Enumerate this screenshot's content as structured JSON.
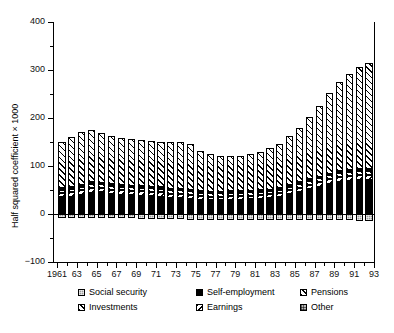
{
  "chart_data": {
    "type": "bar",
    "stacked": true,
    "title": "",
    "xlabel": "",
    "ylabel": "Half squared coefficient × 1000",
    "ylim": [
      -100,
      400
    ],
    "ytick_labels": [
      "400",
      "300",
      "200",
      "100",
      "0",
      "−100"
    ],
    "ytick_values": [
      400,
      300,
      200,
      100,
      0,
      -100
    ],
    "yminor_step": 50,
    "grid": false,
    "legend_position": "bottom",
    "x": [
      1961,
      1962,
      1963,
      1964,
      1965,
      1966,
      1967,
      1968,
      1969,
      1970,
      1971,
      1972,
      1973,
      1974,
      1975,
      1976,
      1977,
      1978,
      1979,
      1980,
      1981,
      1982,
      1983,
      1984,
      1985,
      1986,
      1987,
      1988,
      1989,
      1990,
      1991,
      1992
    ],
    "categories": [
      "1961",
      "62",
      "63",
      "64",
      "65",
      "66",
      "67",
      "68",
      "69",
      "70",
      "71",
      "72",
      "73",
      "74",
      "75",
      "76",
      "77",
      "78",
      "79",
      "80",
      "81",
      "82",
      "83",
      "84",
      "85",
      "86",
      "87",
      "88",
      "89",
      "90",
      "91",
      "92"
    ],
    "xtick_labels_shown": [
      "1961",
      "63",
      "65",
      "67",
      "69",
      "71",
      "73",
      "75",
      "77",
      "79",
      "81",
      "83",
      "85",
      "87",
      "89",
      "91",
      "93"
    ],
    "series": [
      {
        "name": "Social security",
        "pattern": "gray-fine-grid",
        "values": [
          -9,
          -9,
          -8,
          -8,
          -8,
          -9,
          -9,
          -9,
          -10,
          -10,
          -10,
          -11,
          -11,
          -12,
          -12,
          -12,
          -12,
          -12,
          -12,
          -12,
          -12,
          -12,
          -12,
          -12,
          -12,
          -12,
          -13,
          -13,
          -13,
          -13,
          -14,
          -14
        ]
      },
      {
        "name": "Self-employment",
        "pattern": "solid-black",
        "values": [
          36,
          36,
          40,
          44,
          45,
          42,
          40,
          39,
          38,
          37,
          36,
          34,
          33,
          32,
          30,
          29,
          29,
          30,
          30,
          31,
          32,
          33,
          36,
          41,
          46,
          52,
          57,
          62,
          66,
          68,
          70,
          70
        ]
      },
      {
        "name": "Pensions",
        "pattern": "diagonal-hatch-right",
        "values": [
          96,
          104,
          110,
          110,
          103,
          100,
          99,
          98,
          97,
          96,
          95,
          96,
          97,
          94,
          84,
          78,
          74,
          73,
          73,
          76,
          81,
          86,
          92,
          102,
          114,
          130,
          148,
          168,
          186,
          200,
          214,
          222
        ]
      },
      {
        "name": "Investments",
        "pattern": "diagonal-hatch-right-light",
        "values": [
          7,
          8,
          8,
          9,
          8,
          8,
          8,
          8,
          8,
          8,
          8,
          8,
          8,
          8,
          7,
          7,
          7,
          7,
          7,
          7,
          7,
          7,
          7,
          8,
          8,
          8,
          8,
          9,
          9,
          9,
          9,
          9
        ]
      },
      {
        "name": "Earnings",
        "pattern": "diagonal-hatch-left",
        "values": [
          8,
          9,
          9,
          10,
          9,
          9,
          9,
          9,
          9,
          9,
          9,
          8,
          8,
          8,
          7,
          7,
          7,
          7,
          7,
          7,
          7,
          8,
          8,
          8,
          9,
          9,
          10,
          10,
          11,
          11,
          11,
          11
        ]
      },
      {
        "name": "Other",
        "pattern": "gray-grid",
        "values": [
          3,
          3,
          3,
          3,
          3,
          3,
          3,
          3,
          3,
          3,
          3,
          3,
          3,
          3,
          3,
          3,
          3,
          3,
          3,
          3,
          3,
          3,
          3,
          3,
          3,
          3,
          3,
          3,
          3,
          3,
          3,
          3
        ]
      }
    ],
    "totals_positive": [
      150,
      160,
      170,
      176,
      168,
      162,
      159,
      157,
      155,
      153,
      151,
      149,
      149,
      144,
      131,
      124,
      120,
      120,
      120,
      124,
      130,
      137,
      146,
      162,
      180,
      202,
      226,
      252,
      275,
      291,
      307,
      315
    ]
  },
  "legend": {
    "items": [
      {
        "label": "Social security",
        "key": "p-social"
      },
      {
        "label": "Self-employment",
        "key": "p-selfemp"
      },
      {
        "label": "Pensions",
        "key": "p-pensions"
      },
      {
        "label": "Investments",
        "key": "p-invest"
      },
      {
        "label": "Earnings",
        "key": "p-earnings"
      },
      {
        "label": "Other",
        "key": "p-other"
      }
    ]
  }
}
